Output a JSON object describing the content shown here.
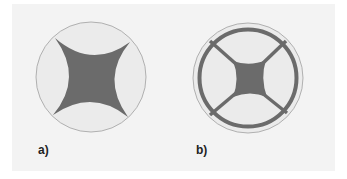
{
  "figure": {
    "panels": [
      {
        "id": "a",
        "label": "a)",
        "description": "Circle containing a four-pointed concave star shape",
        "circle": {
          "cx": 91,
          "cy": 77,
          "r": 55
        },
        "shape": "concave-star"
      },
      {
        "id": "b",
        "label": "b)",
        "description": "Circle with inner thick ring, four diagonal bars and concave square center",
        "circle": {
          "cx": 248,
          "cy": 78,
          "r": 55
        },
        "ring": {
          "r": 48,
          "stroke_width": 4
        },
        "shape": "ring-with-spokes-and-concave-square"
      }
    ],
    "colors": {
      "background": "#f3f3f3",
      "circle_fill": "#ebebeb",
      "circle_stroke": "#a0a0a0",
      "shape_fill": "#6b6b6b"
    }
  }
}
